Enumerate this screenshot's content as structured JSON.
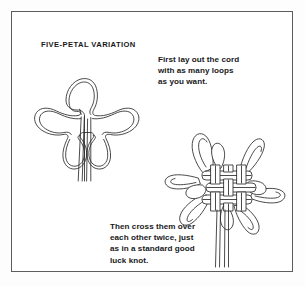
{
  "page": {
    "background_color": "#fdfdfd",
    "panel_color": "#ffffff",
    "border_color": "#5d5d5d",
    "ink_color": "#2b2b2d",
    "text_color": "#18181a"
  },
  "title": "FIVE-PETAL VARIATION",
  "captions": {
    "top": {
      "lines": [
        "First lay out the cord",
        "with as many loops",
        "as you want."
      ]
    },
    "bottom": {
      "lines": [
        "Then cross them over",
        "each other twice, just",
        "as in a standard good",
        "luck knot."
      ]
    }
  },
  "figures": {
    "loose_layout": {
      "name": "five-loop-cord-layout",
      "description": "Cord laid out flat with five loops radiating from a centre, two long tails hanging down",
      "loop_count": 5,
      "tail_count": 2
    },
    "finished_knot": {
      "name": "good-luck-knot",
      "description": "Finished woven good luck knot with interlaced basket-weave centre, loops around the perimeter and two tails below",
      "loop_count": 5,
      "tail_count": 2,
      "crossings": 2
    }
  }
}
